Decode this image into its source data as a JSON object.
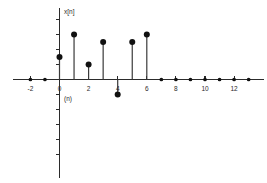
{
  "chart_data": {
    "type": "line",
    "title": "",
    "subtitle": "",
    "xlabel": "(n)",
    "ylabel": "x[n]",
    "grid": false,
    "legend": null,
    "xlim": [
      -3,
      14
    ],
    "ylim": [
      -2,
      4
    ],
    "x_tick_labels": [
      "-2",
      "0",
      "2",
      "4",
      "6",
      "8",
      "10",
      "12"
    ],
    "x_tick_values": [
      -2,
      0,
      2,
      4,
      6,
      8,
      10,
      12
    ],
    "y_tick_labels": [],
    "x": [
      -2,
      -1,
      0,
      1,
      2,
      3,
      4,
      5,
      6,
      7,
      8,
      9,
      10,
      11,
      12,
      13
    ],
    "values": [
      0,
      0,
      1.5,
      3,
      1,
      2.5,
      -1,
      2.5,
      3,
      0,
      0,
      0,
      0,
      0,
      0,
      0
    ],
    "marker": "filled-circle",
    "marker_color": "#111111",
    "stem_color": "#3a3a3a",
    "axis_color": "#2b2b2b"
  },
  "labels": {
    "y_axis_label": "x[n]",
    "x_axis_label": "(n)"
  }
}
